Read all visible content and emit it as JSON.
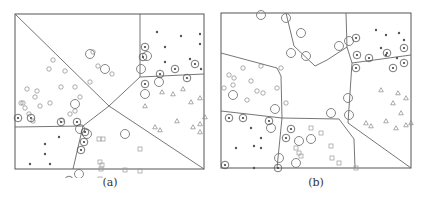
{
  "figure": {
    "panels": [
      {
        "id": "a",
        "caption": "(a)",
        "frame": {
          "x": 15,
          "y": 14,
          "w": 189,
          "h": 155
        },
        "boundaries": [
          "M0,0 L94,92",
          "M94,92 L125,63 L125,0",
          "M125,63 L189,60",
          "M94,92 L189,155",
          "M94,92 L68,112 L0,113",
          "M68,112 L58,155"
        ],
        "circles": [
          [
            34,
            55
          ],
          [
            38,
            46
          ],
          [
            50,
            57
          ],
          [
            75,
            68
          ],
          [
            83,
            52
          ],
          [
            78,
            38
          ],
          [
            97,
            60
          ],
          [
            46,
            73
          ],
          [
            12,
            75
          ],
          [
            22,
            77
          ],
          [
            20,
            83
          ],
          [
            8,
            89
          ],
          [
            10,
            94
          ],
          [
            35,
            89
          ],
          [
            25,
            92
          ],
          [
            60,
            73
          ],
          [
            65,
            83
          ],
          [
            60,
            97
          ],
          [
            55,
            100
          ],
          [
            47,
            106
          ],
          [
            18,
            107
          ],
          [
            14,
            100
          ],
          [
            6,
            89
          ]
        ],
        "circled_stars": [
          [
            130,
            33
          ],
          [
            128,
            43
          ],
          [
            145,
            60
          ],
          [
            160,
            55
          ],
          [
            180,
            50
          ],
          [
            172,
            64
          ],
          [
            130,
            70
          ],
          [
            3,
            104
          ],
          [
            16,
            104
          ],
          [
            46,
            108
          ],
          [
            62,
            108
          ],
          [
            70,
            118
          ],
          [
            69,
            128
          ],
          [
            66,
            136
          ],
          [
            54,
            166
          ]
        ],
        "stars": [
          [
            142,
            18
          ],
          [
            150,
            33
          ],
          [
            166,
            22
          ],
          [
            185,
            20
          ],
          [
            185,
            30
          ],
          [
            150,
            48
          ],
          [
            175,
            45
          ],
          [
            186,
            55
          ],
          [
            30,
            130
          ],
          [
            44,
            123
          ],
          [
            30,
            140
          ],
          [
            35,
            150
          ],
          [
            15,
            150
          ],
          [
            20,
            166
          ]
        ],
        "triangles": [
          [
            147,
            78
          ],
          [
            158,
            80
          ],
          [
            168,
            75
          ],
          [
            185,
            84
          ],
          [
            176,
            88
          ],
          [
            130,
            92
          ],
          [
            178,
            113
          ],
          [
            140,
            113
          ],
          [
            145,
            116
          ],
          [
            162,
            107
          ],
          [
            185,
            110
          ],
          [
            190,
            103
          ],
          [
            185,
            118
          ]
        ],
        "squares": [
          [
            84,
            125
          ],
          [
            88,
            125
          ],
          [
            125,
            135
          ],
          [
            85,
            148
          ],
          [
            87,
            151
          ],
          [
            86,
            155
          ],
          [
            110,
            156
          ],
          [
            125,
            157
          ],
          [
            85,
            165
          ]
        ],
        "big_circles": [
          [
            75,
            40
          ],
          [
            90,
            55
          ],
          [
            132,
            42
          ],
          [
            126,
            55
          ],
          [
            144,
            68
          ],
          [
            130,
            80
          ],
          [
            60,
            90
          ],
          [
            65,
            115
          ],
          [
            72,
            120
          ],
          [
            64,
            160
          ],
          [
            110,
            120
          ]
        ]
      },
      {
        "id": "b",
        "caption": "(b)",
        "frame": {
          "x": 221,
          "y": 13,
          "w": 190,
          "h": 155
        },
        "boundaries": [
          "M65,0 L73,33 L94,53 L106,47 L126,34 L125,0",
          "M126,34 L131,50 L190,42",
          "M131,50 L127,110 L190,155",
          "M0,40 L56,55 L60,63 L61,105 L0,98",
          "M61,105 L118,106 L133,126 L134,155",
          "M61,105 L56,155"
        ],
        "circles": [
          [
            40,
            53
          ],
          [
            60,
            55
          ],
          [
            22,
            55
          ],
          [
            8,
            62
          ],
          [
            13,
            65
          ],
          [
            30,
            68
          ],
          [
            36,
            78
          ],
          [
            12,
            72
          ],
          [
            3,
            75
          ],
          [
            26,
            87
          ],
          [
            42,
            80
          ],
          [
            56,
            75
          ],
          [
            65,
            90
          ]
        ],
        "circled_stars": [
          [
            135,
            25
          ],
          [
            136,
            42
          ],
          [
            148,
            45
          ],
          [
            166,
            40
          ],
          [
            183,
            35
          ],
          [
            183,
            50
          ],
          [
            172,
            55
          ],
          [
            135,
            55
          ],
          [
            8,
            105
          ],
          [
            22,
            105
          ],
          [
            48,
            108
          ],
          [
            70,
            116
          ],
          [
            65,
            125
          ],
          [
            57,
            155
          ],
          [
            4,
            152
          ]
        ],
        "stars": [
          [
            155,
            17
          ],
          [
            165,
            22
          ],
          [
            178,
            20
          ],
          [
            183,
            27
          ],
          [
            160,
            35
          ],
          [
            165,
            42
          ],
          [
            176,
            45
          ],
          [
            30,
            115
          ],
          [
            40,
            125
          ],
          [
            33,
            133
          ],
          [
            40,
            135
          ],
          [
            15,
            135
          ],
          [
            33,
            155
          ]
        ],
        "triangles": [
          [
            160,
            77
          ],
          [
            177,
            80
          ],
          [
            172,
            90
          ],
          [
            185,
            85
          ],
          [
            180,
            100
          ],
          [
            165,
            108
          ],
          [
            145,
            110
          ],
          [
            150,
            113
          ],
          [
            175,
            115
          ],
          [
            190,
            110
          ],
          [
            185,
            112
          ]
        ],
        "squares": [
          [
            90,
            115
          ],
          [
            100,
            120
          ],
          [
            110,
            133
          ],
          [
            75,
            135
          ],
          [
            78,
            140
          ],
          [
            80,
            143
          ],
          [
            111,
            145
          ],
          [
            118,
            150
          ],
          [
            135,
            155
          ]
        ],
        "big_circles": [
          [
            40,
            2
          ],
          [
            65,
            5
          ],
          [
            80,
            20
          ],
          [
            118,
            33
          ],
          [
            128,
            28
          ],
          [
            70,
            40
          ],
          [
            85,
            43
          ],
          [
            12,
            82
          ],
          [
            54,
            96
          ],
          [
            50,
            115
          ],
          [
            78,
            128
          ],
          [
            90,
            126
          ],
          [
            127,
            85
          ],
          [
            110,
            100
          ],
          [
            128,
            102
          ],
          [
            58,
            145
          ],
          [
            75,
            150
          ]
        ]
      }
    ]
  }
}
